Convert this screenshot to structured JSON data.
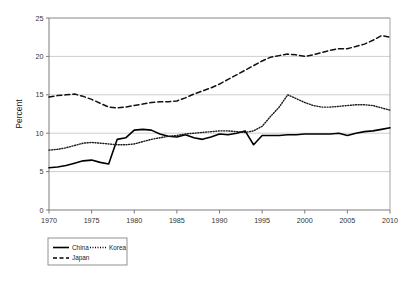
{
  "chart_data": {
    "type": "line",
    "title": "",
    "xlabel": "",
    "ylabel": "Percent",
    "xlim": [
      1970,
      2010
    ],
    "ylim": [
      0,
      25
    ],
    "grid": "horizontal",
    "legend_position": "bottom-left",
    "xticks": [
      1970,
      1975,
      1980,
      1985,
      1990,
      1995,
      2000,
      2005,
      2010
    ],
    "yticks": [
      0,
      5,
      10,
      15,
      20,
      25
    ],
    "x": [
      1970,
      1971,
      1972,
      1973,
      1974,
      1975,
      1976,
      1977,
      1978,
      1979,
      1980,
      1981,
      1982,
      1983,
      1984,
      1985,
      1986,
      1987,
      1988,
      1989,
      1990,
      1991,
      1992,
      1993,
      1994,
      1995,
      1996,
      1997,
      1998,
      1999,
      2000,
      2001,
      2002,
      2003,
      2004,
      2005,
      2006,
      2007,
      2008,
      2009,
      2010
    ],
    "series": [
      {
        "name": "China",
        "style": "solid",
        "color": "#000000",
        "values": [
          5.5,
          5.6,
          5.8,
          6.1,
          6.4,
          6.5,
          6.2,
          6.0,
          9.2,
          9.4,
          10.4,
          10.5,
          10.4,
          9.9,
          9.6,
          9.5,
          9.8,
          9.4,
          9.2,
          9.5,
          9.9,
          9.8,
          10.0,
          10.3,
          8.5,
          9.7,
          9.7,
          9.7,
          9.8,
          9.8,
          9.9,
          9.9,
          9.9,
          9.9,
          10.0,
          9.7,
          10.0,
          10.2,
          10.3,
          10.5,
          10.7
        ]
      },
      {
        "name": "Korea",
        "style": "dotted",
        "color": "#1a1a1a",
        "values": [
          7.8,
          7.9,
          8.1,
          8.4,
          8.7,
          8.8,
          8.7,
          8.6,
          8.5,
          8.5,
          8.6,
          8.9,
          9.2,
          9.4,
          9.6,
          9.7,
          9.9,
          10.0,
          10.1,
          10.2,
          10.3,
          10.3,
          10.2,
          10.1,
          10.3,
          10.9,
          12.2,
          13.4,
          15.0,
          14.5,
          14.0,
          13.6,
          13.4,
          13.4,
          13.5,
          13.6,
          13.7,
          13.7,
          13.6,
          13.3,
          13.0
        ]
      },
      {
        "name": "Japan",
        "style": "dashed",
        "color": "#111111",
        "values": [
          14.7,
          14.9,
          15.0,
          15.1,
          14.8,
          14.4,
          13.9,
          13.4,
          13.3,
          13.4,
          13.6,
          13.8,
          14.0,
          14.1,
          14.1,
          14.2,
          14.6,
          15.1,
          15.5,
          15.9,
          16.4,
          17.0,
          17.6,
          18.2,
          18.8,
          19.4,
          19.9,
          20.1,
          20.3,
          20.2,
          20.0,
          20.2,
          20.5,
          20.8,
          21.0,
          21.0,
          21.3,
          21.6,
          22.1,
          22.7,
          22.5
        ]
      }
    ]
  },
  "legend": {
    "items": [
      {
        "label": "China",
        "style": "solid"
      },
      {
        "label": "Korea",
        "style": "dotted"
      },
      {
        "label": "Japan",
        "style": "dashed"
      }
    ]
  }
}
